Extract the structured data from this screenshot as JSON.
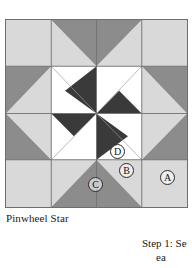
{
  "block": {
    "name": "Pinwheel Star",
    "grid": "4x4",
    "colors": {
      "light": "#d9d9d9",
      "medium": "#8c8c8c",
      "dark": "#3a3a3a",
      "white": "#ffffff",
      "outline": "#6e6e6e",
      "label_ink": "#111111",
      "page_background": "#ffffff"
    },
    "patch_labels": [
      {
        "id": "A",
        "text": "A",
        "patch": "corner-square-light"
      },
      {
        "id": "B",
        "text": "B",
        "patch": "flying-geese-medium-triangle"
      },
      {
        "id": "C",
        "text": "C",
        "patch": "flying-geese-light-triangle"
      },
      {
        "id": "D",
        "text": "D",
        "patch": "center-white-triangle"
      }
    ]
  },
  "instructions": {
    "step_line_1": "Step 1: Se",
    "step_line_2": "ea"
  }
}
